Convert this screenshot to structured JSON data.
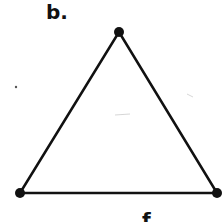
{
  "figure": {
    "label": "b.",
    "partial_label_bottom": "f",
    "shape": "triangle",
    "stroke_color": "#111111",
    "background": "#ffffff",
    "vertices": [
      {
        "name": "top",
        "x": 119,
        "y": 32
      },
      {
        "name": "bottom-left",
        "x": 20,
        "y": 193
      },
      {
        "name": "bottom-right",
        "x": 217,
        "y": 193
      }
    ]
  }
}
